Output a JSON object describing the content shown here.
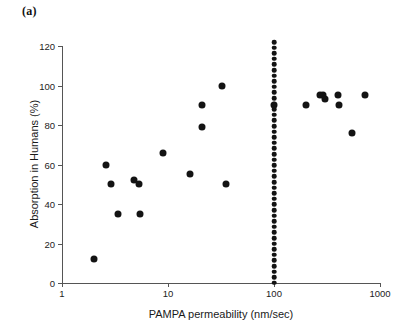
{
  "figure": {
    "panel_label": "(a)"
  },
  "chart_data": {
    "type": "scatter",
    "title": "",
    "xlabel": "PAMPA permeability (nm/sec)",
    "ylabel": "Absorption in Humans (%)",
    "xscale": "log",
    "yscale": "linear",
    "xlim": [
      1,
      1000
    ],
    "ylim": [
      0,
      120
    ],
    "xticks": [
      1,
      10,
      100,
      1000
    ],
    "xtick_labels": [
      "1",
      "10",
      "100",
      "1000"
    ],
    "yticks": [
      0,
      20,
      40,
      60,
      80,
      100,
      120
    ],
    "ytick_labels": [
      "0",
      "20",
      "40",
      "60",
      "80",
      "100",
      "120"
    ],
    "grid": false,
    "legend": false,
    "marker": "filled-circle",
    "marker_color": "#131313",
    "series": [
      {
        "name": "Compounds",
        "points": [
          {
            "x": 2.0,
            "y": 12
          },
          {
            "x": 2.6,
            "y": 60
          },
          {
            "x": 2.9,
            "y": 50
          },
          {
            "x": 3.4,
            "y": 35
          },
          {
            "x": 4.8,
            "y": 52
          },
          {
            "x": 5.3,
            "y": 50
          },
          {
            "x": 5.5,
            "y": 35
          },
          {
            "x": 9.0,
            "y": 66
          },
          {
            "x": 16.0,
            "y": 55
          },
          {
            "x": 21.0,
            "y": 90
          },
          {
            "x": 21.0,
            "y": 79
          },
          {
            "x": 32.0,
            "y": 100
          },
          {
            "x": 35.0,
            "y": 50
          },
          {
            "x": 100.0,
            "y": 90
          },
          {
            "x": 200.0,
            "y": 90
          },
          {
            "x": 270.0,
            "y": 95
          },
          {
            "x": 290.0,
            "y": 95
          },
          {
            "x": 300.0,
            "y": 93
          },
          {
            "x": 400.0,
            "y": 95
          },
          {
            "x": 410.0,
            "y": 90
          },
          {
            "x": 550.0,
            "y": 76
          },
          {
            "x": 720.0,
            "y": 95
          }
        ]
      }
    ],
    "annotations": [
      {
        "name": "permeability-threshold-line",
        "type": "vertical-dotted-line",
        "x": 100,
        "y_from": 0,
        "y_to": 122,
        "color": "#131313"
      }
    ]
  }
}
